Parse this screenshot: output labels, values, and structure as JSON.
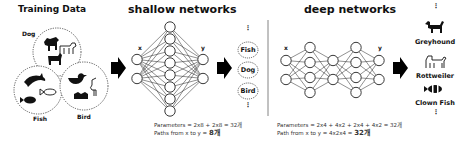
{
  "training": {
    "title": "Training Data",
    "classes": [
      "Dog",
      "Fish",
      "Bird"
    ]
  },
  "shallow": {
    "title": "shallow networks",
    "input_label": "x",
    "output_label": "y",
    "layers": [
      2,
      8,
      2
    ],
    "formula_params": "Parameters = 2x8 + 2x8 = 32개",
    "formula_paths_prefix": "Paths from x to y = ",
    "formula_paths_value": "8개"
  },
  "intermediate": {
    "ellipsis_top": "⋮",
    "items": [
      "Fish",
      "Dog",
      "Bird"
    ],
    "ellipsis_bottom": "⋮"
  },
  "deep": {
    "title": "deep networks",
    "input_label": "x",
    "output_label": "y",
    "layers": [
      2,
      4,
      2,
      4,
      2
    ],
    "formula_params": "Parameters = 2x4 + 4x2 + 2x4 + 4x2 = 32개",
    "formula_paths_prefix": "Path from x to y = 4x2x4 = ",
    "formula_paths_value": "32개"
  },
  "outputs": {
    "ellipsis_top": "⋮",
    "items": [
      "Greyhound",
      "Rottweiler",
      "Clown Fish"
    ],
    "ellipsis_bottom": "⋮"
  }
}
